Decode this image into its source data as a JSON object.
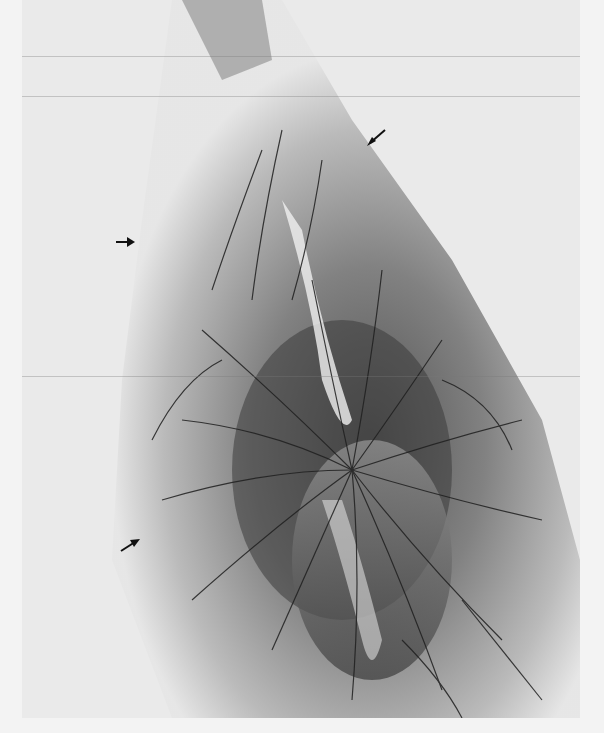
{
  "figure": {
    "arrows": [
      {
        "name": "arrow-top-right",
        "x": 373,
        "y": 138,
        "direction": "down-left"
      },
      {
        "name": "arrow-left-middle",
        "x": 125,
        "y": 242,
        "direction": "right"
      },
      {
        "name": "arrow-left-lower",
        "x": 128,
        "y": 546,
        "direction": "up-right"
      }
    ],
    "caption_partial": "",
    "colors": {
      "background": "#f3f3f3",
      "dark": "#2a2a2a",
      "mid": "#8a8a8a",
      "light": "#d8d8d8"
    }
  }
}
